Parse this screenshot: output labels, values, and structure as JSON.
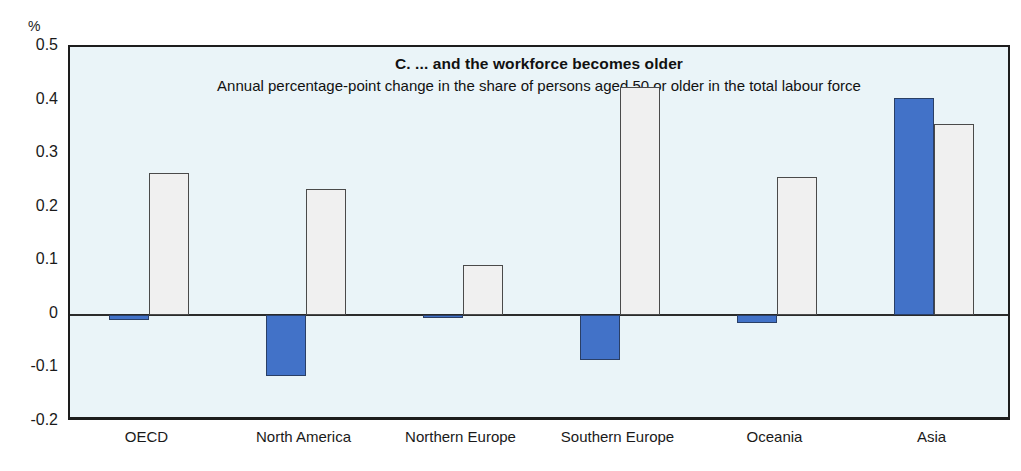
{
  "chart_data": {
    "type": "bar",
    "title": "C.  ... and the workforce becomes older",
    "subtitle": "Annual percentage-point change in the share of persons aged 50 or older in the total labour force",
    "unit_label": "%",
    "xlabel": "",
    "ylabel": "",
    "ylim": [
      -0.2,
      0.5
    ],
    "yticks": [
      "0.5",
      "0.4",
      "0.3",
      "0.2",
      "0.1",
      "0",
      "-0.1",
      "-0.2"
    ],
    "ytick_values": [
      0.5,
      0.4,
      0.3,
      0.2,
      0.1,
      0,
      -0.1,
      -0.2
    ],
    "grid": false,
    "legend_position": "none",
    "categories": [
      "OECD",
      "North America",
      "Northern Europe",
      "Southern Europe",
      "Oceania",
      "Asia"
    ],
    "series": [
      {
        "name": "series-blue",
        "color": "#4272c8",
        "values": [
          -0.01,
          -0.115,
          -0.005,
          -0.085,
          -0.015,
          0.405
        ]
      },
      {
        "name": "series-white",
        "color": "#f0f0f0",
        "values": [
          0.265,
          0.235,
          0.093,
          0.425,
          0.258,
          0.357
        ]
      }
    ]
  },
  "colors": {
    "accent_blue": "#4272c8",
    "bar_white": "#f0f0f0",
    "plot_background": "#eaf4f8",
    "axis_line": "#1d1d1d"
  }
}
